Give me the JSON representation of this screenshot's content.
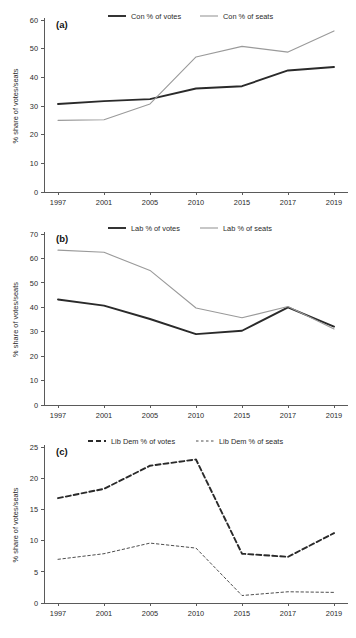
{
  "figure": {
    "width": 356,
    "height": 638,
    "background": "#ffffff",
    "axis_label": "% share of votes/seats",
    "x_categories": [
      "1997",
      "2001",
      "2005",
      "2010",
      "2015",
      "2017",
      "2019"
    ]
  },
  "panels": [
    {
      "tag": "(a)",
      "y_ticks": [
        "0",
        "10",
        "20",
        "30",
        "40",
        "50",
        "60"
      ],
      "legend": [
        {
          "label": "Con % of votes",
          "color": "#2a2a2a",
          "dash": "none",
          "width": 1.9
        },
        {
          "label": "Con % of seats",
          "color": "#9a9a9a",
          "dash": "none",
          "width": 1.1
        }
      ]
    },
    {
      "tag": "(b)",
      "y_ticks": [
        "0",
        "10",
        "20",
        "30",
        "40",
        "50",
        "60",
        "70"
      ],
      "legend": [
        {
          "label": "Lab % of votes",
          "color": "#2a2a2a",
          "dash": "none",
          "width": 1.9
        },
        {
          "label": "Lab % of seats",
          "color": "#9a9a9a",
          "dash": "none",
          "width": 1.1
        }
      ]
    },
    {
      "tag": "(c)",
      "y_ticks": [
        "0",
        "5",
        "10",
        "15",
        "20",
        "25"
      ],
      "legend": [
        {
          "label": "Lib Dem % of votes",
          "color": "#2a2a2a",
          "dash": "5,3",
          "width": 1.9
        },
        {
          "label": "Lib Dem % of seats",
          "color": "#3a3a3a",
          "dash": "2.5,2.5",
          "width": 0.9
        }
      ]
    }
  ],
  "chart_data": [
    {
      "type": "line",
      "title": "(a)",
      "xlabel": "",
      "ylabel": "% share of votes/seats",
      "categories": [
        "1997",
        "2001",
        "2005",
        "2010",
        "2015",
        "2017",
        "2019"
      ],
      "ylim": [
        0,
        60
      ],
      "yticks": [
        0,
        10,
        20,
        30,
        40,
        50,
        60
      ],
      "grid": false,
      "legend_position": "top",
      "series": [
        {
          "name": "Con % of votes",
          "values": [
            30.7,
            31.7,
            32.4,
            36.1,
            36.9,
            42.4,
            43.6
          ]
        },
        {
          "name": "Con % of seats",
          "values": [
            25.0,
            25.2,
            30.7,
            47.1,
            50.8,
            48.8,
            56.2
          ]
        }
      ]
    },
    {
      "type": "line",
      "title": "(b)",
      "xlabel": "",
      "ylabel": "% share of votes/seats",
      "categories": [
        "1997",
        "2001",
        "2005",
        "2010",
        "2015",
        "2017",
        "2019"
      ],
      "ylim": [
        0,
        70
      ],
      "yticks": [
        0,
        10,
        20,
        30,
        40,
        50,
        60,
        70
      ],
      "grid": false,
      "legend_position": "top",
      "series": [
        {
          "name": "Lab % of votes",
          "values": [
            43.2,
            40.7,
            35.2,
            29.0,
            30.4,
            40.0,
            32.1
          ]
        },
        {
          "name": "Lab % of seats",
          "values": [
            63.4,
            62.5,
            55.1,
            39.7,
            35.7,
            40.3,
            31.1
          ]
        }
      ]
    },
    {
      "type": "line",
      "title": "(c)",
      "xlabel": "",
      "ylabel": "% share of votes/seats",
      "categories": [
        "1997",
        "2001",
        "2005",
        "2010",
        "2015",
        "2017",
        "2019"
      ],
      "ylim": [
        0,
        25
      ],
      "yticks": [
        0,
        5,
        10,
        15,
        20,
        25
      ],
      "grid": false,
      "legend_position": "top",
      "series": [
        {
          "name": "Lib Dem % of votes",
          "values": [
            16.8,
            18.3,
            22.0,
            23.0,
            7.9,
            7.4,
            11.2
          ]
        },
        {
          "name": "Lib Dem % of seats",
          "values": [
            7.0,
            7.9,
            9.6,
            8.8,
            1.2,
            1.8,
            1.7
          ]
        }
      ]
    }
  ]
}
